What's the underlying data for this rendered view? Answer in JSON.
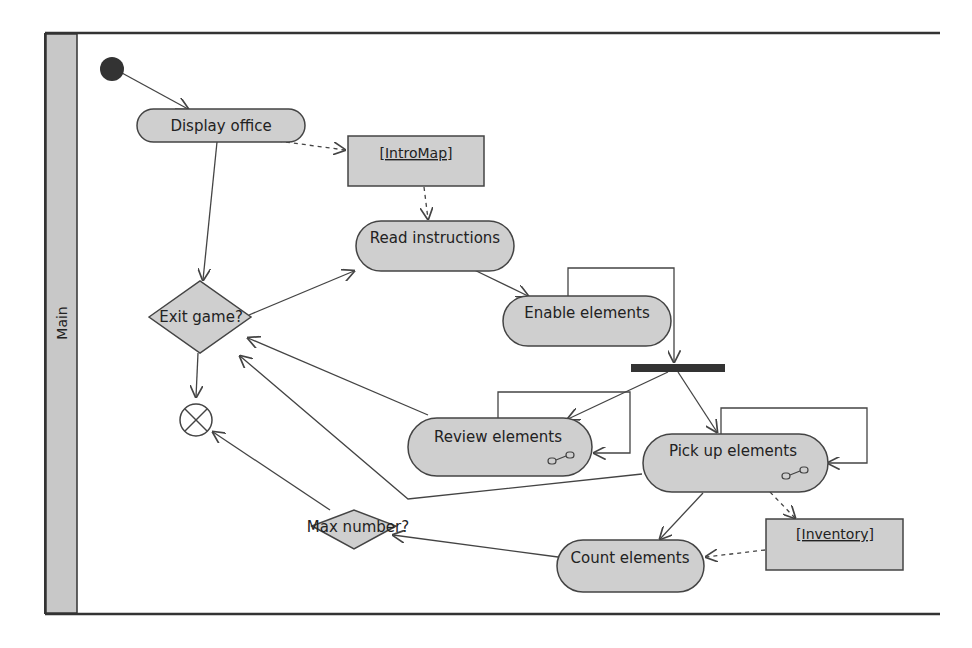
{
  "swimlane": {
    "label": "Main"
  },
  "activities": {
    "display_office": "Display office",
    "read_instructions": "Read instructions",
    "enable_elements": "Enable elements",
    "review_elements": "Review elements",
    "pick_up_elements": "Pick up elements",
    "count_elements": "Count elements"
  },
  "decisions": {
    "exit_game": "Exit game?",
    "max_number": "Max number?"
  },
  "objects": {
    "intro_map": "[IntroMap]",
    "inventory": "[Inventory]"
  },
  "colors": {
    "node_fill": "#cfcfcf",
    "line": "#444444",
    "lane_fill": "#c8c8c8",
    "initial": "#333333"
  }
}
